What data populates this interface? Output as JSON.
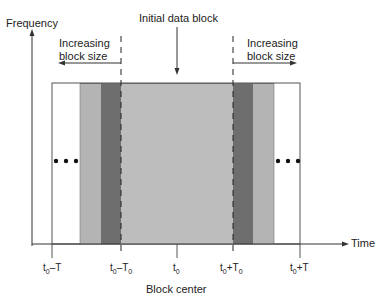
{
  "figure": {
    "y_axis_label": "Frequency",
    "x_axis_label": "Time",
    "center_label": "Initial data block",
    "left_annotation": [
      "Increasing",
      "block size"
    ],
    "right_annotation": [
      "Increasing",
      "block size"
    ],
    "bottom_caption": "Block center",
    "ticks": [
      {
        "base": "t",
        "sub": "0",
        "suffix": "–T",
        "suffix_sub": ""
      },
      {
        "base": "t",
        "sub": "0",
        "suffix": "–T",
        "suffix_sub": "0"
      },
      {
        "base": "t",
        "sub": "0",
        "suffix": "",
        "suffix_sub": ""
      },
      {
        "base": "t",
        "sub": "0",
        "suffix": "+T",
        "suffix_sub": "0"
      },
      {
        "base": "t",
        "sub": "0",
        "suffix": "+T",
        "suffix_sub": ""
      }
    ],
    "ellipsis": "•••",
    "colors": {
      "outer_block": "#ffffff",
      "light_gray": "#b4b4b4",
      "dark_gray": "#6e6e6e",
      "center_block": "#bdbdbd",
      "axis": "#333333"
    }
  }
}
